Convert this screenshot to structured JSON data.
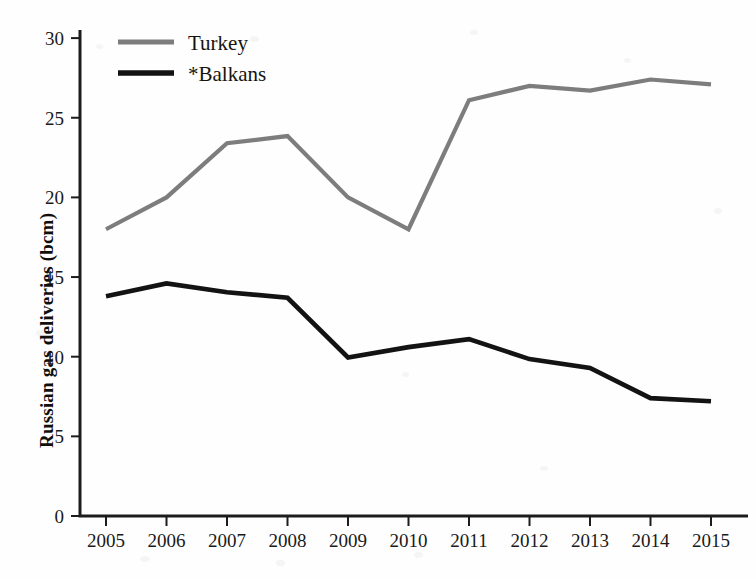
{
  "chart_data": {
    "type": "line",
    "title": "",
    "xlabel": "",
    "ylabel": "Russian gas deliveries (bcm)",
    "categories": [
      "2005",
      "2006",
      "2007",
      "2008",
      "2009",
      "2010",
      "2011",
      "2012",
      "2013",
      "2014",
      "2015"
    ],
    "x": [
      2005,
      2006,
      2007,
      2008,
      2009,
      2010,
      2011,
      2012,
      2013,
      2014,
      2015
    ],
    "xlim": [
      2005,
      2015
    ],
    "ylim": [
      0,
      31.5
    ],
    "yticks": [
      0,
      5,
      10,
      15,
      20,
      25,
      30
    ],
    "ytick_labels": [
      "0",
      "5",
      "10",
      "15",
      "20",
      "25",
      "30"
    ],
    "grid": false,
    "legend_position": "top-left",
    "series": [
      {
        "name": "Turkey",
        "color": "#7d7d7d",
        "values": [
          18.0,
          20.0,
          23.4,
          23.85,
          20.0,
          18.0,
          26.1,
          27.0,
          26.7,
          27.4,
          27.1
        ]
      },
      {
        "name": "*Balkans",
        "color": "#131313",
        "values": [
          13.8,
          14.6,
          14.05,
          13.7,
          9.95,
          10.6,
          11.1,
          9.85,
          9.3,
          7.4,
          7.2
        ]
      }
    ]
  },
  "legend": {
    "entries": [
      {
        "label": "Turkey",
        "swatch": "legend-swatch-turkey"
      },
      {
        "label": "*Balkans",
        "swatch": "legend-swatch-balkans"
      }
    ]
  },
  "axes": {
    "y_title": "Russian gas deliveries (bcm)"
  }
}
